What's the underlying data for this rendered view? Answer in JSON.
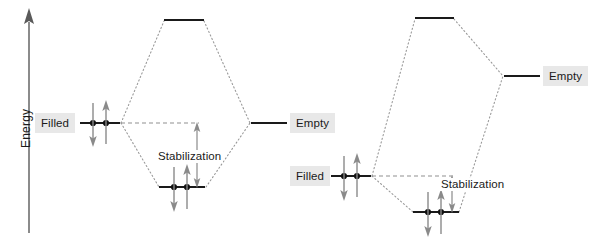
{
  "figure": {
    "width": 589,
    "height": 247,
    "background": "#ffffff",
    "type": "molecular-orbital-interaction-diagram"
  },
  "axis": {
    "label": "Energy",
    "direction": "up",
    "color": "#5a5a5a"
  },
  "colors": {
    "orbital_line": "#1a1a1a",
    "correlation_line": "#8c8c8c",
    "arrow_gray": "#8a8a8a",
    "label_background": "#e8e8e8",
    "text": "#1a1a1a",
    "electron_dot": "#111111"
  },
  "diagrams": [
    {
      "name": "left-diagram",
      "fragment_orbitals": [
        {
          "name": "filled-orbital-left",
          "label": "Filled",
          "occupancy": "filled",
          "electrons": 2,
          "energy_y": 123,
          "x1": 80,
          "x2": 120,
          "label_x": 35,
          "label_y": 114
        },
        {
          "name": "empty-orbital-left",
          "label": "Empty",
          "occupancy": "empty",
          "electrons": 0,
          "energy_y": 123,
          "x1": 251,
          "x2": 287,
          "label_x": 291,
          "label_y": 114
        }
      ],
      "molecular_orbitals": [
        {
          "name": "antibonding-mo-left",
          "occupancy": "empty",
          "electrons": 0,
          "energy_y": 20,
          "x1": 164,
          "x2": 204
        },
        {
          "name": "bonding-mo-left",
          "occupancy": "filled",
          "electrons": 2,
          "energy_y": 187,
          "x1": 159,
          "x2": 205
        }
      ],
      "stabilization": {
        "label": "Stabilization",
        "label_x": 158,
        "label_y": 150,
        "arrow_x": 197,
        "arrow_top_y": 123,
        "arrow_bottom_y": 187,
        "double_headed": true
      }
    },
    {
      "name": "right-diagram",
      "fragment_orbitals": [
        {
          "name": "filled-orbital-right",
          "label": "Filled",
          "occupancy": "filled",
          "electrons": 2,
          "energy_y": 176,
          "x1": 331,
          "x2": 371,
          "label_x": 291,
          "label_y": 167
        },
        {
          "name": "empty-orbital-right",
          "label": "Empty",
          "occupancy": "empty",
          "electrons": 0,
          "energy_y": 76,
          "x1": 504,
          "x2": 540,
          "label_x": 544,
          "label_y": 67
        }
      ],
      "molecular_orbitals": [
        {
          "name": "antibonding-mo-right",
          "occupancy": "empty",
          "electrons": 0,
          "energy_y": 18,
          "x1": 415,
          "x2": 454
        },
        {
          "name": "bonding-mo-right",
          "occupancy": "filled",
          "electrons": 2,
          "energy_y": 212,
          "x1": 413,
          "x2": 459
        }
      ],
      "stabilization": {
        "label": "Stabilization",
        "label_x": 441,
        "label_y": 178,
        "arrow_x": 452,
        "arrow_top_y": 176,
        "arrow_bottom_y": 212,
        "double_headed": true
      }
    }
  ]
}
